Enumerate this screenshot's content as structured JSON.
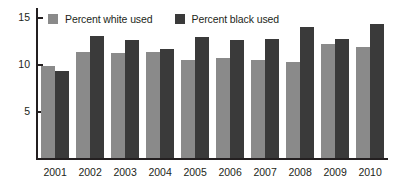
{
  "chart_data": {
    "type": "bar",
    "title": "",
    "subtitle": "",
    "xlabel": "",
    "ylabel": "",
    "categories": [
      "2001",
      "2002",
      "2003",
      "2004",
      "2005",
      "2006",
      "2007",
      "2008",
      "2009",
      "2010"
    ],
    "series": [
      {
        "name": "Percent white used",
        "color": "#8a8a8a",
        "values": [
          9.9,
          11.4,
          11.2,
          11.3,
          10.5,
          10.7,
          10.5,
          10.3,
          12.2,
          11.9
        ]
      },
      {
        "name": "Percent black used",
        "color": "#3a3a3a",
        "values": [
          9.3,
          13.1,
          12.6,
          11.7,
          13.0,
          12.6,
          12.7,
          14.0,
          12.7,
          14.3
        ]
      }
    ],
    "ylim": [
      0,
      16
    ],
    "yticks": [
      5,
      10,
      15
    ],
    "ytick_labels": [
      "5",
      "10",
      "15"
    ],
    "grid": false,
    "legend_position": "top-left",
    "axis_color": "#231f20",
    "background": "#ffffff"
  },
  "legend": {
    "items": [
      {
        "label": "Percent white used",
        "color": "#8a8a8a",
        "swatch_name": "legend-swatch-white-used"
      },
      {
        "label": "Percent black used",
        "color": "#3a3a3a",
        "swatch_name": "legend-swatch-black-used"
      }
    ]
  }
}
